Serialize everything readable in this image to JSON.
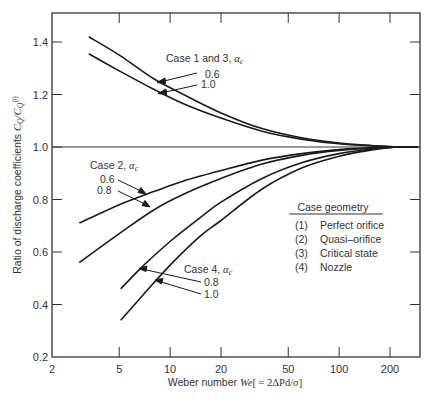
{
  "chart_data": {
    "type": "line",
    "title": "",
    "xlabel": "Weber number We[ = 2ΔPd/σ]",
    "xlabel_parts": {
      "prefix": "Weber number ",
      "symbol": "We",
      "suffix": "[ = 2ΔPd/σ]"
    },
    "ylabel": "Ratio of discharge coefficients C_Q/C_Q^(i)",
    "ylabel_parts": {
      "prefix": "Ratio of discharge coefficients ",
      "symbol": "C",
      "sub": "Q",
      "sep": "/C",
      "sub2": "Q",
      "sup": "(i)"
    },
    "x_scale": "log",
    "xlim": [
      2,
      290
    ],
    "ylim": [
      0.2,
      1.5
    ],
    "x_ticks": [
      2,
      5,
      10,
      20,
      50,
      100,
      200
    ],
    "x_tick_labels": [
      "2",
      "5",
      "10",
      "20",
      "50",
      "100",
      "200"
    ],
    "y_ticks": [
      0.2,
      0.4,
      0.6,
      0.8,
      1.0,
      1.2,
      1.4
    ],
    "y_tick_labels": [
      "0.2",
      "0.4",
      "0.6",
      "0.8",
      "1.0",
      "1.2",
      "1.4"
    ],
    "grid": false,
    "reference_line": {
      "y": 1.0
    },
    "series": [
      {
        "name": "Case 1 and 3, αc = 0.6",
        "x": [
          3.3,
          5,
          8,
          12,
          20,
          35,
          60,
          100,
          160,
          220,
          290
        ],
        "y": [
          1.42,
          1.35,
          1.26,
          1.2,
          1.13,
          1.07,
          1.035,
          1.015,
          1.005,
          1.0,
          1.0
        ]
      },
      {
        "name": "Case 1 and 3, αc = 1.0",
        "x": [
          3.3,
          5,
          8,
          12,
          20,
          35,
          60,
          100,
          160,
          220,
          290
        ],
        "y": [
          1.355,
          1.29,
          1.22,
          1.165,
          1.11,
          1.06,
          1.03,
          1.012,
          1.004,
          1.0,
          1.0
        ]
      },
      {
        "name": "Case 2, αc = 0.6",
        "x": [
          2.9,
          5,
          8,
          12,
          20,
          35,
          60,
          100,
          160,
          220,
          290
        ],
        "y": [
          0.71,
          0.78,
          0.83,
          0.87,
          0.91,
          0.95,
          0.975,
          0.99,
          0.997,
          1.0,
          1.0
        ]
      },
      {
        "name": "Case 2, αc = 0.8",
        "x": [
          2.9,
          5,
          8,
          12,
          20,
          35,
          60,
          100,
          160,
          220,
          290
        ],
        "y": [
          0.56,
          0.67,
          0.76,
          0.82,
          0.88,
          0.935,
          0.968,
          0.987,
          0.996,
          1.0,
          1.0
        ]
      },
      {
        "name": "Case 4, αc = 0.8",
        "x": [
          5.1,
          7,
          10,
          15,
          20,
          35,
          60,
          100,
          160,
          220,
          290
        ],
        "y": [
          0.46,
          0.55,
          0.64,
          0.73,
          0.79,
          0.88,
          0.94,
          0.975,
          0.993,
          1.0,
          1.0
        ]
      },
      {
        "name": "Case 4, αc = 1.0",
        "x": [
          5.1,
          7,
          10,
          15,
          20,
          35,
          60,
          100,
          160,
          220,
          290
        ],
        "y": [
          0.34,
          0.44,
          0.55,
          0.66,
          0.72,
          0.84,
          0.92,
          0.965,
          0.99,
          1.0,
          1.0
        ]
      }
    ],
    "annotations": [
      {
        "group": "Case 1 and 3",
        "text": "Case 1 and 3, ",
        "symbol": "α",
        "sub": "c",
        "values": [
          "0.6",
          "1.0"
        ]
      },
      {
        "group": "Case 2",
        "text": "Case 2, ",
        "symbol": "α",
        "sub": "c",
        "values": [
          "0.6",
          "0.8"
        ]
      },
      {
        "group": "Case 4",
        "text": "Case 4, ",
        "symbol": "α",
        "sub": "c",
        "values": [
          "0.8",
          "1.0"
        ]
      }
    ],
    "legend": {
      "title": "Case geometry",
      "position": "right-center",
      "entries": [
        {
          "num": "(1)",
          "label": "Perfect orifice"
        },
        {
          "num": "(2)",
          "label": "Quasi–orifice"
        },
        {
          "num": "(3)",
          "label": "Critical state"
        },
        {
          "num": "(4)",
          "label": "Nozzle"
        }
      ]
    },
    "colors": {
      "line": "#1a1a1a",
      "axis": "#333333",
      "text": "#333333"
    }
  }
}
